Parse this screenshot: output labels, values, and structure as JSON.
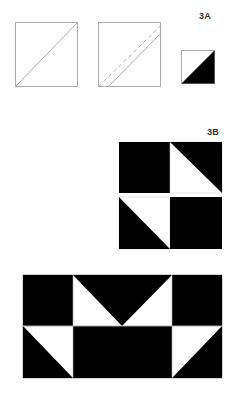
{
  "section_a": {
    "label": "3A",
    "steps": [
      {
        "name": "square-with-diagonal",
        "description": "square drawn with diagonal line"
      },
      {
        "name": "square-with-seam",
        "description": "diagonal seam (dashed) with stitching line offset"
      },
      {
        "name": "half-square-triangle",
        "description": "finished half-square triangle: white upper-left, black lower-right"
      }
    ]
  },
  "section_b": {
    "label": "3B",
    "grid": {
      "rows": 2,
      "cols": 2,
      "cells": [
        [
          "solid-black",
          "hst-black-upper-right"
        ],
        [
          "hst-black-lower-left",
          "solid-black"
        ]
      ]
    }
  },
  "section_c": {
    "grid": {
      "rows": 2,
      "cols": 4,
      "cells": [
        [
          "solid-black",
          "hst-black-upper-right",
          "hst-black-upper-left",
          "solid-black"
        ],
        [
          "hst-black-lower-left",
          "solid-black",
          "solid-black",
          "hst-black-lower-right"
        ]
      ]
    }
  },
  "colors": {
    "fill": "#000000",
    "background": "#ffffff",
    "outline": "#aaaaaa",
    "label": "#333333"
  }
}
